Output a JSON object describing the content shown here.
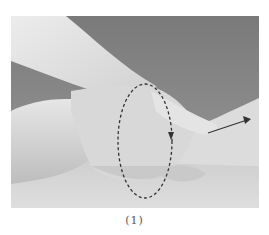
{
  "figure": {
    "caption": "(1)",
    "annotations": [
      {
        "type": "dashed-ellipse",
        "meaning": "rotation around wrist",
        "arrowhead": "down"
      },
      {
        "type": "arrow",
        "direction": "up-right",
        "meaning": "traction along forearm"
      }
    ],
    "colors": {
      "background_top": "#7e7e7e",
      "background_bottom": "#d9d9d9",
      "skin_light": "#e8e8e8",
      "skin_mid": "#cfcfcf",
      "skin_shadow": "#a9a9a9",
      "annotation": "#333333"
    }
  }
}
